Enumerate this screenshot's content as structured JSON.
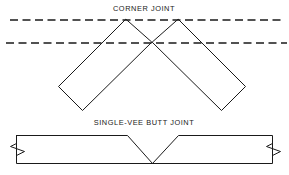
{
  "figure": {
    "title_top": "CORNER JOINT",
    "title_bottom": "SINGLE-VEE BUTT JOINT",
    "line_color": "#1a1a1a",
    "background_color": "#ffffff"
  },
  "corner_joint": {
    "label": "CORNER JOINT",
    "label_x": 144,
    "label_y": 11,
    "reference_lines": [
      {
        "name": "upper-dashed-reference-line",
        "x1": 10,
        "y1": 20,
        "x2": 283,
        "y2": 20
      },
      {
        "name": "lower-dashed-reference-line",
        "x1": 6,
        "y1": 43,
        "x2": 287,
        "y2": 43
      }
    ],
    "plates": [
      {
        "name": "left-plate",
        "points": "125.5,19.5 58.5,86.5 82.5,110.5 151.5,42.5"
      },
      {
        "name": "right-plate",
        "points": "178.5,19.5 245.5,86.5 221.5,110.5 152.5,42.5"
      }
    ]
  },
  "butt_joint": {
    "label": "SINGLE-VEE BUTT JOINT",
    "label_x": 144,
    "label_y": 125,
    "plate_outline": "16.5,135.5 127.5,135.5 152.5,163.5 178.5,135.5 272.5,135.5 272.5,163.5 16.5,163.5 16.5,135.5",
    "left_break": "16.5,143.5 10.5,146.5 24.5,151.5 16.5,155.5",
    "right_break": "272.5,143.5 266.5,146.5 280.5,151.5 272.5,155.5"
  }
}
